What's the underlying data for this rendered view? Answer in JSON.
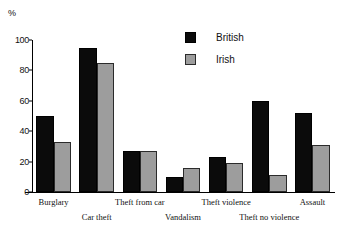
{
  "chart_data": {
    "type": "bar",
    "title": "",
    "xlabel": "",
    "ylabel": "%",
    "ylim": [
      0,
      100
    ],
    "yticks": [
      0,
      20,
      40,
      60,
      80,
      100
    ],
    "grid": false,
    "legend_position": "top-right",
    "categories": [
      "Burglary",
      "Car theft",
      "Theft from car",
      "Vandalism",
      "Theft violence",
      "Theft no violence",
      "Assault"
    ],
    "series": [
      {
        "name": "British",
        "color": "#0b0b0b",
        "values": [
          50,
          95,
          27,
          10,
          23,
          60,
          52
        ]
      },
      {
        "name": "Irish",
        "color": "#9d9d9d",
        "values": [
          33,
          85,
          27,
          16,
          19,
          11,
          31
        ]
      }
    ]
  },
  "axis": {
    "unit_label": "%"
  },
  "legend": {
    "entries": [
      {
        "label": "British"
      },
      {
        "label": "Irish"
      }
    ]
  }
}
